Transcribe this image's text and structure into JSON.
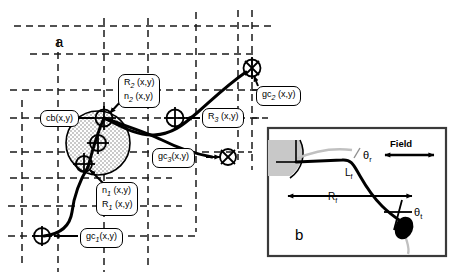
{
  "figure": {
    "panel_a": {
      "letter": "a",
      "description": "Plant root and shoot architecture over a dashed soil grid",
      "callouts": [
        {
          "id": "cb",
          "lines": [
            "cb(x,y)"
          ]
        },
        {
          "id": "r2n2",
          "lines": [
            "R2 (x,y)",
            "n2 (x,y)"
          ]
        },
        {
          "id": "gc2",
          "lines": [
            "gc2 (x,y)"
          ]
        },
        {
          "id": "r3",
          "lines": [
            "R3 (x,y)"
          ]
        },
        {
          "id": "gc3",
          "lines": [
            "gc3(x,y)"
          ]
        },
        {
          "id": "n1r1",
          "lines": [
            "n1 (x,y)",
            "R1 (x,y)"
          ]
        },
        {
          "id": "gc1",
          "lines": [
            "gc1(x,y)"
          ]
        }
      ]
    },
    "panel_b": {
      "letter": "b",
      "field_label": "Field",
      "angle_r": "θ",
      "angle_r_sub": "r",
      "angle_t": "θ",
      "angle_t_sub": "t",
      "length_l": "L",
      "length_l_sub": "f",
      "length_r": "R",
      "length_r_sub": "f"
    },
    "colors": {
      "line": "#000000",
      "grid": "#1a1a1a",
      "stipple": "#d9d9d9",
      "wedge": "#c8c8c8",
      "ghost": "#c0c0c0",
      "panel_bg": "#ffffff"
    }
  }
}
